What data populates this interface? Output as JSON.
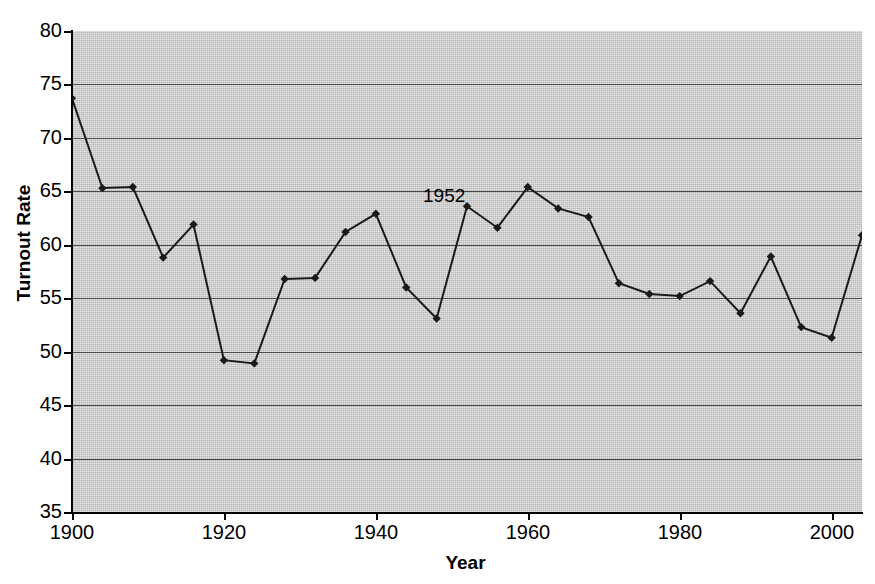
{
  "chart_data": {
    "type": "line",
    "title": "",
    "xlabel": "Year",
    "ylabel": "Turnout Rate",
    "xlim": [
      1900,
      2004
    ],
    "ylim": [
      35,
      80
    ],
    "grid": true,
    "legend": "none",
    "marker": "diamond",
    "line_color": "#1a1a1a",
    "plot_background": "#c9c9c9",
    "gridline_color": "#4a4a4a",
    "x_ticks": [
      1900,
      1920,
      1940,
      1960,
      1980,
      2000
    ],
    "y_ticks": [
      35,
      40,
      45,
      50,
      55,
      60,
      65,
      70,
      75,
      80
    ],
    "x": [
      1900,
      1904,
      1908,
      1912,
      1916,
      1920,
      1924,
      1928,
      1932,
      1936,
      1940,
      1944,
      1948,
      1952,
      1956,
      1960,
      1964,
      1968,
      1972,
      1976,
      1980,
      1984,
      1988,
      1992,
      1996,
      2000,
      2004
    ],
    "values": [
      73.7,
      65.3,
      65.4,
      58.8,
      61.9,
      49.2,
      48.9,
      56.8,
      56.9,
      61.2,
      62.9,
      56.0,
      53.1,
      63.6,
      61.6,
      65.4,
      63.4,
      62.6,
      56.4,
      55.4,
      55.2,
      56.6,
      53.6,
      58.9,
      52.3,
      51.3,
      60.9
    ],
    "annotations": [
      {
        "text": "1952",
        "x": 1952,
        "y": 64.6
      }
    ]
  }
}
